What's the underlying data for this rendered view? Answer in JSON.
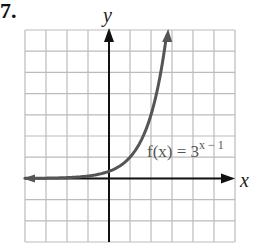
{
  "problem": {
    "number": "7."
  },
  "chart_data": {
    "type": "line",
    "title": "",
    "function_label": "f(x) = 3^(x − 1)",
    "function_label_parts": {
      "lhs": "f(x) = 3",
      "exponent": "x − 1"
    },
    "xlabel": "x",
    "ylabel": "y",
    "xlim": [
      -4,
      6
    ],
    "ylim": [
      -3,
      7
    ],
    "grid": true,
    "grid_step": 1,
    "series": [
      {
        "name": "f(x) = 3^(x − 1)",
        "x": [
          -4,
          -3,
          -2,
          -1,
          0,
          1,
          2,
          2.5,
          2.77
        ],
        "y": [
          0.004,
          0.012,
          0.037,
          0.111,
          0.333,
          1,
          3,
          5.196,
          7
        ]
      }
    ],
    "colors": {
      "curve": "#555555",
      "axes": "#111111",
      "grid": "#bbbbbb"
    }
  }
}
